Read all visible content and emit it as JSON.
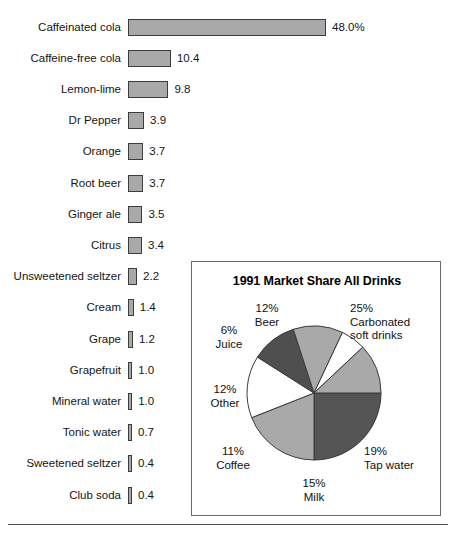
{
  "chart_data": [
    {
      "type": "bar",
      "title": "",
      "orientation": "horizontal",
      "xlabel": "",
      "ylabel": "",
      "value_suffix": "%",
      "xlim": [
        0,
        48.0
      ],
      "grid": false,
      "legend": "none",
      "bar_color": "#a9a9a9",
      "bar_border_color": "#3c3c3c",
      "categories": [
        "Caffeinated cola",
        "Caffeine-free cola",
        "Lemon-lime",
        "Dr Pepper",
        "Orange",
        "Root beer",
        "Ginger ale",
        "Citrus",
        "Unsweetened seltzer",
        "Cream",
        "Grape",
        "Grapefruit",
        "Mineral water",
        "Tonic water",
        "Sweetened seltzer",
        "Club soda"
      ],
      "values": [
        48.0,
        10.4,
        9.8,
        3.9,
        3.7,
        3.7,
        3.5,
        3.4,
        2.2,
        1.4,
        1.2,
        1.0,
        1.0,
        0.7,
        0.4,
        0.4
      ],
      "value_labels": [
        "48.0%",
        "10.4",
        "9.8",
        "3.9",
        "3.7",
        "3.7",
        "3.5",
        "3.4",
        "2.2",
        "1.4",
        "1.2",
        "1.0",
        "1.0",
        "0.7",
        "0.4",
        "0.4"
      ]
    },
    {
      "type": "pie",
      "title": "1991 Market Share All Drinks",
      "legend": "labels-outside",
      "start_angle_deg": 0,
      "direction": "clockwise",
      "labels": [
        "Carbonated soft drinks",
        "Tap water",
        "Milk",
        "Coffee",
        "Other",
        "Juice",
        "Beer"
      ],
      "values": [
        25,
        19,
        15,
        11,
        12,
        6,
        12
      ],
      "value_labels": [
        "25%",
        "19%",
        "15%",
        "11%",
        "12%",
        "6%",
        "12%"
      ],
      "slice_colors": [
        "#555555",
        "#a9a9a9",
        "#ffffff",
        "#4f4f4f",
        "#a9a9a9",
        "#ffffff",
        "#a9a9a9"
      ],
      "callouts": [
        {
          "pct": "25%",
          "name_line1": "Carbonated",
          "name_line2": "soft drinks"
        },
        {
          "pct": "19%",
          "name_line1": "Tap water",
          "name_line2": ""
        },
        {
          "pct": "15%",
          "name_line1": "Milk",
          "name_line2": ""
        },
        {
          "pct": "11%",
          "name_line1": "Coffee",
          "name_line2": ""
        },
        {
          "pct": "12%",
          "name_line1": "Other",
          "name_line2": ""
        },
        {
          "pct": "6%",
          "name_line1": "Juice",
          "name_line2": ""
        },
        {
          "pct": "12%",
          "name_line1": "Beer",
          "name_line2": ""
        }
      ]
    }
  ],
  "bar_chart": {
    "rows": [
      {
        "label": "Caffeinated cola",
        "value_label": "48.0%"
      },
      {
        "label": "Caffeine-free cola",
        "value_label": "10.4"
      },
      {
        "label": "Lemon-lime",
        "value_label": "9.8"
      },
      {
        "label": "Dr Pepper",
        "value_label": "3.9"
      },
      {
        "label": "Orange",
        "value_label": "3.7"
      },
      {
        "label": "Root beer",
        "value_label": "3.7"
      },
      {
        "label": "Ginger ale",
        "value_label": "3.5"
      },
      {
        "label": "Citrus",
        "value_label": "3.4"
      },
      {
        "label": "Unsweetened seltzer",
        "value_label": "2.2"
      },
      {
        "label": "Cream",
        "value_label": "1.4"
      },
      {
        "label": "Grape",
        "value_label": "1.2"
      },
      {
        "label": "Grapefruit",
        "value_label": "1.0"
      },
      {
        "label": "Mineral water",
        "value_label": "1.0"
      },
      {
        "label": "Tonic water",
        "value_label": "0.7"
      },
      {
        "label": "Sweetened seltzer",
        "value_label": "0.4"
      },
      {
        "label": "Club soda",
        "value_label": "0.4"
      }
    ]
  },
  "pie_chart": {
    "title": "1991 Market Share All Drinks",
    "labels": {
      "carbonated": {
        "pct": "25%",
        "l1": "Carbonated",
        "l2": "soft drinks"
      },
      "tap_water": {
        "pct": "19%",
        "l1": "Tap water",
        "l2": ""
      },
      "milk": {
        "pct": "15%",
        "l1": "Milk",
        "l2": ""
      },
      "coffee": {
        "pct": "11%",
        "l1": "Coffee",
        "l2": ""
      },
      "other": {
        "pct": "12%",
        "l1": "Other",
        "l2": ""
      },
      "juice": {
        "pct": "6%",
        "l1": "Juice",
        "l2": ""
      },
      "beer": {
        "pct": "12%",
        "l1": "Beer",
        "l2": ""
      }
    }
  }
}
